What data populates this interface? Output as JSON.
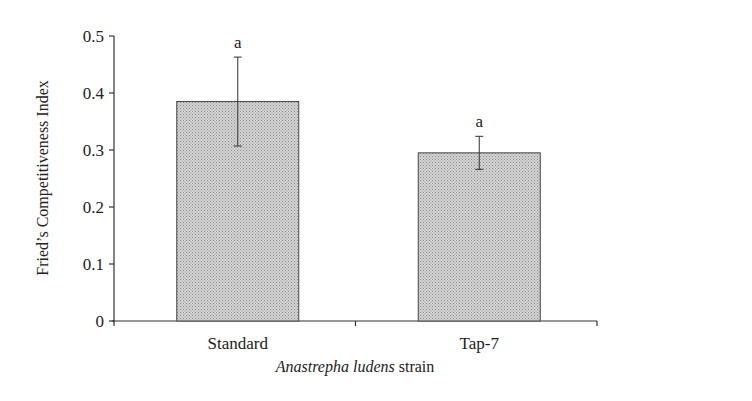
{
  "chart_data": {
    "type": "bar",
    "title": "",
    "xlabel_italic": "Anastrepha ludens",
    "xlabel_rest": " strain",
    "ylabel": "Fried’s Competitiveness Index",
    "categories": [
      "Standard",
      "Tap-7"
    ],
    "values": [
      0.385,
      0.295
    ],
    "errors": [
      0.078,
      0.029
    ],
    "significance_letters": [
      "a",
      "a"
    ],
    "ylim": [
      0,
      0.5
    ],
    "yticks": [
      0,
      0.1,
      0.2,
      0.3,
      0.4,
      0.5
    ],
    "ytick_labels": [
      "0",
      "0.1",
      "0.2",
      "0.3",
      "0.4",
      "0.5"
    ],
    "grid": false,
    "legend": null,
    "colors": {
      "bar_fill": "#c8c8c8",
      "bar_stroke": "#444444",
      "axis": "#333333"
    }
  }
}
